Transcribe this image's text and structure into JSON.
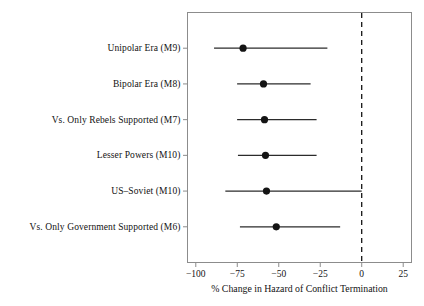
{
  "chart_data": {
    "type": "scatter",
    "title": "",
    "subtitle": "",
    "xlabel": "% Change in Hazard of Conflict Termination",
    "ylabel": "",
    "xlim": [
      -105,
      30
    ],
    "xticks": [
      -100,
      -75,
      -50,
      -25,
      0,
      25
    ],
    "xticklabels": [
      "−100",
      "−75",
      "−50",
      "−25",
      "0",
      "25"
    ],
    "grid": false,
    "legend": null,
    "reference_line": {
      "value": 0,
      "style": "dashed",
      "color": "#000000"
    },
    "orientation": "horizontal",
    "marker": "filled-circle",
    "categories": [
      "Unipolar Era (M9)",
      "Bipolar Era (M8)",
      "Vs. Only Rebels Supported (M7)",
      "Lesser Powers (M10)",
      "US–Soviet (M10)",
      "Vs. Only Government Supported (M6)"
    ],
    "points": [
      {
        "label": "Unipolar Era (M9)",
        "estimate": -71.5,
        "ci_low": -89.0,
        "ci_high": -20.7
      },
      {
        "label": "Bipolar Era (M8)",
        "estimate": -59.2,
        "ci_low": -75.1,
        "ci_high": -30.8
      },
      {
        "label": "Vs. Only Rebels Supported (M7)",
        "estimate": -58.6,
        "ci_low": -75.1,
        "ci_high": -27.2
      },
      {
        "label": "Lesser Powers (M10)",
        "estimate": -58.0,
        "ci_low": -74.6,
        "ci_high": -27.2
      },
      {
        "label": "US–Soviet (M10)",
        "estimate": -57.4,
        "ci_low": -82.2,
        "ci_high": 0.0
      },
      {
        "label": "Vs. Only Government Supported (M6)",
        "estimate": -51.5,
        "ci_low": -73.4,
        "ci_high": -13.0
      }
    ],
    "estimates": [
      -71.5,
      -59.2,
      -58.6,
      -58.0,
      -57.4,
      -51.5
    ],
    "ci_low": [
      -89.0,
      -75.1,
      -75.1,
      -74.6,
      -82.2,
      -73.4
    ],
    "ci_high": [
      -20.7,
      -30.8,
      -27.2,
      -27.2,
      0.0,
      -13.0
    ]
  },
  "style": {
    "marker_color": "#141414",
    "line_color": "#2b2b2b",
    "frame_color": "#8c8c8c",
    "zero_line_color": "#000000",
    "background": "#ffffff"
  }
}
